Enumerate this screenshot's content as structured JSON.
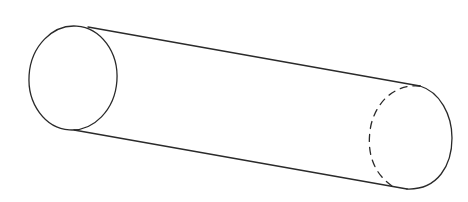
{
  "figure": {
    "colors": {
      "background": "#ffffff",
      "line": "#2a2a2a"
    },
    "left_cap": {
      "cx": 73,
      "cy": 78,
      "rx": 44,
      "ry": 52
    },
    "right_cap": {
      "cx": 410,
      "cy": 137,
      "rx": 42,
      "ry": 53
    },
    "top_edge": {
      "x1": 88,
      "y1": 28,
      "x2": 420,
      "y2": 86
    },
    "bottom_edge": {
      "x1": 74,
      "y1": 130,
      "x2": 408,
      "y2": 189
    }
  }
}
